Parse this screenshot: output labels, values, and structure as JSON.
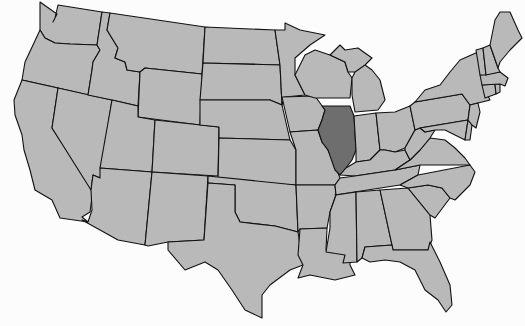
{
  "map": {
    "title": "United States map with Illinois highlighted",
    "region": "Contiguous United States",
    "highlighted_state": "Illinois",
    "colors": {
      "state_fill": "#b9b9b9",
      "highlight_fill": "#6e6e6e",
      "border": "#111111",
      "background": "#fcfcfc"
    },
    "states": [
      {
        "name": "Washington"
      },
      {
        "name": "Oregon"
      },
      {
        "name": "California"
      },
      {
        "name": "Nevada"
      },
      {
        "name": "Idaho"
      },
      {
        "name": "Montana"
      },
      {
        "name": "Wyoming"
      },
      {
        "name": "Utah"
      },
      {
        "name": "Arizona"
      },
      {
        "name": "Colorado"
      },
      {
        "name": "New Mexico"
      },
      {
        "name": "North Dakota"
      },
      {
        "name": "South Dakota"
      },
      {
        "name": "Nebraska"
      },
      {
        "name": "Kansas"
      },
      {
        "name": "Oklahoma"
      },
      {
        "name": "Texas"
      },
      {
        "name": "Minnesota"
      },
      {
        "name": "Iowa"
      },
      {
        "name": "Missouri"
      },
      {
        "name": "Arkansas"
      },
      {
        "name": "Louisiana"
      },
      {
        "name": "Wisconsin"
      },
      {
        "name": "Illinois"
      },
      {
        "name": "Michigan"
      },
      {
        "name": "Indiana"
      },
      {
        "name": "Ohio"
      },
      {
        "name": "Kentucky"
      },
      {
        "name": "Tennessee"
      },
      {
        "name": "Mississippi"
      },
      {
        "name": "Alabama"
      },
      {
        "name": "Georgia"
      },
      {
        "name": "Florida"
      },
      {
        "name": "South Carolina"
      },
      {
        "name": "North Carolina"
      },
      {
        "name": "Virginia"
      },
      {
        "name": "West Virginia"
      },
      {
        "name": "Pennsylvania"
      },
      {
        "name": "New York"
      },
      {
        "name": "Maryland"
      },
      {
        "name": "Delaware"
      },
      {
        "name": "New Jersey"
      },
      {
        "name": "Connecticut"
      },
      {
        "name": "Rhode Island"
      },
      {
        "name": "Massachusetts"
      },
      {
        "name": "Vermont"
      },
      {
        "name": "New Hampshire"
      },
      {
        "name": "Maine"
      }
    ]
  }
}
